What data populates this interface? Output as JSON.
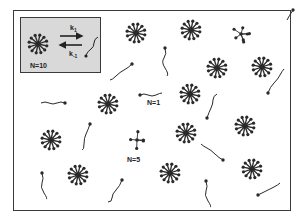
{
  "figure": {
    "colors": {
      "ink": "#2a2a2a",
      "inset_bg": "#d9d9d9",
      "frame": "#3a3a3a",
      "background": "#ffffff"
    }
  },
  "inset": {
    "aggregate_label": "N=10",
    "forward_rate": {
      "symbol": "k",
      "subscript": "1"
    },
    "reverse_rate": {
      "symbol": "k",
      "subscript": "-1"
    }
  },
  "labels": {
    "monomer": "N=1",
    "partial_micelle": "N=5"
  },
  "micelles": [
    {
      "x": 136,
      "y": 33,
      "arms": 12
    },
    {
      "x": 191,
      "y": 30,
      "arms": 12
    },
    {
      "x": 217,
      "y": 68,
      "arms": 12
    },
    {
      "x": 262,
      "y": 67,
      "arms": 12
    },
    {
      "x": 108,
      "y": 104,
      "arms": 12
    },
    {
      "x": 190,
      "y": 94,
      "arms": 12
    },
    {
      "x": 186,
      "y": 133,
      "arms": 12
    },
    {
      "x": 245,
      "y": 126,
      "arms": 12
    },
    {
      "x": 51,
      "y": 140,
      "arms": 12
    },
    {
      "x": 78,
      "y": 175,
      "arms": 12
    },
    {
      "x": 170,
      "y": 173,
      "arms": 12
    },
    {
      "x": 252,
      "y": 169,
      "arms": 12
    }
  ],
  "partial_micelles": [
    {
      "x": 241,
      "y": 34,
      "arms": 7
    },
    {
      "x": 137,
      "y": 140,
      "arms": 5
    }
  ],
  "monomers": [
    {
      "head": [
        132,
        64
      ],
      "tail": "M132 64 q-4 4 -8 6 t-8 6 t-6 4"
    },
    {
      "head": [
        165,
        48
      ],
      "tail": "M165 48 q2 6 -1 10 t1 10 t2 8"
    },
    {
      "head": [
        65,
        103
      ],
      "tail": "M65 103 q-4 -2 -8 0 t-8 0 t-8 0"
    },
    {
      "head": [
        140,
        95
      ],
      "tail": "M140 95 q4 -2 8 0 t8 0 t6 -2"
    },
    {
      "head": [
        90,
        124
      ],
      "tail": "M90 124 q-2 6 -4 10 t-2 10 t-2 6"
    },
    {
      "head": [
        207,
        118
      ],
      "tail": "M207 118 q2 -6 4 -10 t2 -8 t4 -6"
    },
    {
      "head": [
        268,
        93
      ],
      "tail": "M268 93 q2 -6 6 -10 t6 -8 t4 -6"
    },
    {
      "head": [
        42,
        173
      ],
      "tail": "M42 173 q2 6 0 10 t2 10 t2 6"
    },
    {
      "head": [
        122,
        180
      ],
      "tail": "M122 180 q-2 6 -6 10 t-4 8 t-4 4"
    },
    {
      "head": [
        223,
        160
      ],
      "tail": "M223 160 q-4 -2 -8 -6 t-8 -6 t-6 -4"
    },
    {
      "head": [
        206,
        181
      ],
      "tail": "M206 181 q2 6 0 10 t2 10 t2 6"
    },
    {
      "head": [
        258,
        195
      ],
      "tail": "M258 195 q4 -2 8 -4 t8 -4 t6 -4"
    },
    {
      "head": [
        293,
        10
      ],
      "tail": "M293 10 q-4 6 -6 10"
    }
  ]
}
